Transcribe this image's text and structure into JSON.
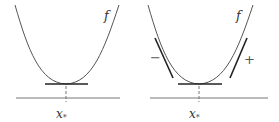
{
  "panels": [
    {
      "id": "left",
      "function_label": "f",
      "point_label": "x",
      "point_subscript": "*",
      "tangent": "horizontal tangent at minimum"
    },
    {
      "id": "right",
      "function_label": "f",
      "point_label": "x",
      "point_subscript": "*",
      "left_sign": "−",
      "right_sign": "+",
      "tangent": "horizontal tangent at minimum with negative slope tangent on left and positive slope tangent on right"
    }
  ],
  "colors": {
    "curve": "#555555",
    "tangent": "#222222",
    "axis": "#777777"
  }
}
